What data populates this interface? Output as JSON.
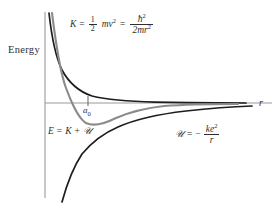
{
  "figure": {
    "background_color": "#ffffff",
    "axes": {
      "y_label": "Energy",
      "x_label": "r",
      "axis_color": "#8c8c8c",
      "origin_px": {
        "x": 45,
        "y": 103
      },
      "x_axis_end_px": 272,
      "y_axis_top_px": 12,
      "y_axis_bottom_px": 198
    },
    "ticks": [
      {
        "name": "bohr-radius",
        "label": "a",
        "sublabel": "0",
        "x_px": 88
      }
    ],
    "curves": [
      {
        "name": "kinetic-energy-curve",
        "symbol": "K",
        "color": "#1a1a1a",
        "width": 1.6,
        "shape": "inverse-square",
        "description": "K = hbar^2 / (2 m r^2), decays from top toward zero"
      },
      {
        "name": "total-energy-curve",
        "symbol": "E",
        "color": "#8a8a8a",
        "width": 2.0,
        "shape": "effective-potential-well",
        "description": "E = K + U, has minimum at a0 then rises to zero"
      },
      {
        "name": "potential-energy-curve",
        "symbol": "U",
        "color": "#1a1a1a",
        "width": 1.6,
        "shape": "negative-inverse",
        "description": "U = -ke^2/r, rises from bottom toward zero"
      }
    ],
    "equations": {
      "kinetic": {
        "lhs": "K",
        "equals": "=",
        "half_num": "1",
        "half_den": "2",
        "mv2_m": "m",
        "mv2_v": "v",
        "mv2_exp": "2",
        "equals2": "=",
        "frac_num_h": "ħ",
        "frac_num_exp": "2",
        "frac_den": "2mr",
        "frac_den_exp": "2"
      },
      "total": {
        "text_e": "E",
        "eq": "=",
        "text_k": "K",
        "plus": "+",
        "text_u": "𝒰"
      },
      "potential": {
        "text_u": "𝒰",
        "eq": "=",
        "minus": "−",
        "num_k": "k",
        "num_e": "e",
        "num_exp": "2",
        "den_r": "r"
      }
    }
  }
}
